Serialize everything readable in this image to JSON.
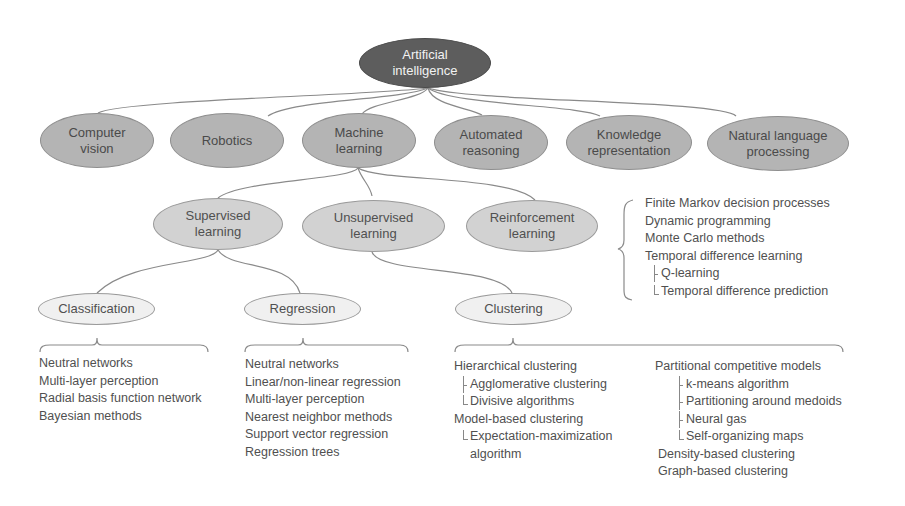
{
  "diagram": {
    "root": {
      "label": "Artificial\nintelligence"
    },
    "fields": [
      {
        "label": "Computer\nvision"
      },
      {
        "label": "Robotics"
      },
      {
        "label": "Machine\nlearning"
      },
      {
        "label": "Automated\nreasoning"
      },
      {
        "label": "Knowledge\nrepresentation"
      },
      {
        "label": "Natural language\nprocessing"
      }
    ],
    "ml_types": [
      {
        "label": "Supervised\nlearning"
      },
      {
        "label": "Unsupervised\nlearning"
      },
      {
        "label": "Reinforcement\nlearning"
      }
    ],
    "tasks": [
      {
        "label": "Classification"
      },
      {
        "label": "Regression"
      },
      {
        "label": "Clustering"
      }
    ],
    "reinforcement_methods": [
      "Finite Markov decision processes",
      "Dynamic programming",
      "Monte Carlo methods",
      "Temporal difference learning",
      "Q-learning",
      "Temporal difference prediction"
    ],
    "classification_methods": [
      "Neutral networks",
      "Multi-layer perception",
      "Radial basis function network",
      "Bayesian methods"
    ],
    "regression_methods": [
      "Neutral networks",
      "Linear/non-linear regression",
      "Multi-layer perception",
      "Nearest neighbor methods",
      "Support vector regression",
      "Regression trees"
    ],
    "clustering_methods_left": [
      "Hierarchical clustering",
      "Agglomerative clustering",
      "Divisive algorithms",
      "Model-based clustering",
      "Expectation-maximization",
      "algorithm"
    ],
    "clustering_methods_right": [
      "Partitional competitive models",
      "k-means algorithm",
      "Partitioning around medoids",
      "Neural gas",
      "Self-organizing maps",
      "Density-based clustering",
      "Graph-based clustering"
    ]
  }
}
